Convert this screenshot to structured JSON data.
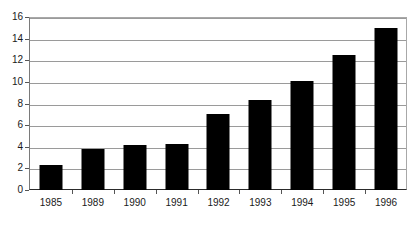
{
  "chart_data": {
    "type": "bar",
    "title": "",
    "subtitle": "",
    "xlabel": "",
    "ylabel": "",
    "categories": [
      "1985",
      "1989",
      "1990",
      "1991",
      "1992",
      "1993",
      "1994",
      "1995",
      "1996"
    ],
    "values": [
      2.3,
      3.8,
      4.2,
      4.3,
      7.0,
      8.3,
      10.1,
      12.5,
      15.0
    ],
    "series": [
      {
        "name": "",
        "values": [
          2.3,
          3.8,
          4.2,
          4.3,
          7.0,
          8.3,
          10.1,
          12.5,
          15.0
        ]
      }
    ],
    "ylim": [
      0,
      16
    ],
    "xlim": [
      0,
      9
    ],
    "yticks": [
      0,
      2,
      4,
      6,
      8,
      10,
      12,
      14,
      16
    ],
    "ytick_labels": [
      "0",
      "2",
      "4",
      "6",
      "8",
      "10",
      "12",
      "14",
      "16"
    ],
    "grid": "horizontal",
    "legend": "none",
    "bar_color": "#000000",
    "gridline_color": "#9a9a9a",
    "axis_color": "#2a2a2a",
    "background_color": "#ffffff",
    "annotations": []
  }
}
